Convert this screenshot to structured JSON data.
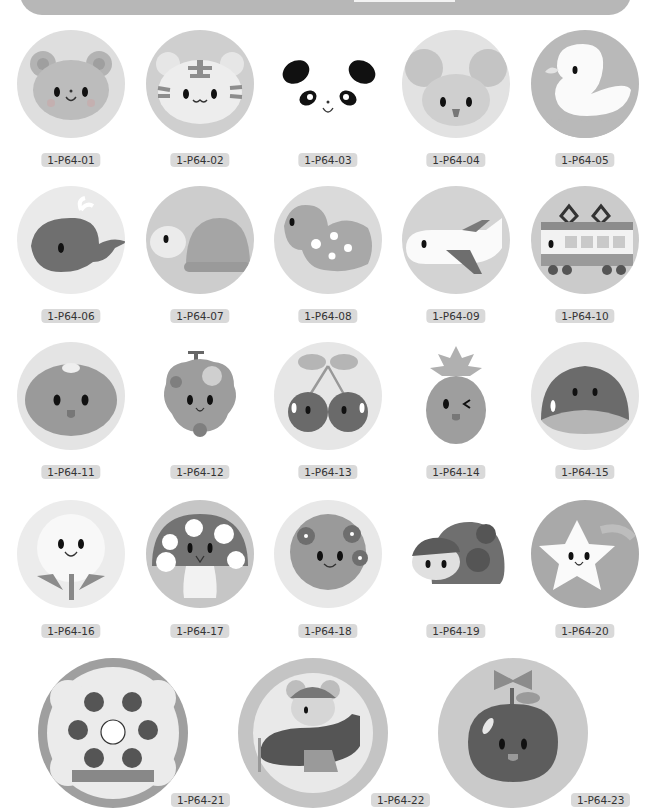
{
  "banner": {
    "tab_label": ""
  },
  "items": [
    {
      "id": "1-P64-01",
      "subject": "bear",
      "icon": "bear-icon",
      "bg": "#dedede"
    },
    {
      "id": "1-P64-02",
      "subject": "tiger",
      "icon": "tiger-icon",
      "bg": "#cfcfcf"
    },
    {
      "id": "1-P64-03",
      "subject": "panda",
      "icon": "panda-icon",
      "bg": "#ffffff"
    },
    {
      "id": "1-P64-04",
      "subject": "mouse",
      "icon": "mouse-icon",
      "bg": "#e2e2e2"
    },
    {
      "id": "1-P64-05",
      "subject": "duck",
      "icon": "duck-icon",
      "bg": "#b9b9b9"
    },
    {
      "id": "1-P64-06",
      "subject": "whale",
      "icon": "whale-icon",
      "bg": "#eaeaea"
    },
    {
      "id": "1-P64-07",
      "subject": "turtle",
      "icon": "turtle-icon",
      "bg": "#cdcdcd"
    },
    {
      "id": "1-P64-08",
      "subject": "dinosaur",
      "icon": "dinosaur-icon",
      "bg": "#dadada"
    },
    {
      "id": "1-P64-09",
      "subject": "airplane",
      "icon": "airplane-icon",
      "bg": "#d3d3d3"
    },
    {
      "id": "1-P64-10",
      "subject": "train",
      "icon": "train-icon",
      "bg": "#cbcbcb"
    },
    {
      "id": "1-P64-11",
      "subject": "orange",
      "icon": "orange-icon",
      "bg": "#e4e4e4"
    },
    {
      "id": "1-P64-12",
      "subject": "grapes",
      "icon": "grapes-icon",
      "bg": "#ffffff"
    },
    {
      "id": "1-P64-13",
      "subject": "cherries",
      "icon": "cherries-icon",
      "bg": "#e6e6e6"
    },
    {
      "id": "1-P64-14",
      "subject": "pineapple",
      "icon": "pineapple-icon",
      "bg": "#ffffff"
    },
    {
      "id": "1-P64-15",
      "subject": "chestnut",
      "icon": "chestnut-icon",
      "bg": "#e4e4e4"
    },
    {
      "id": "1-P64-16",
      "subject": "dandelion",
      "icon": "dandelion-icon",
      "bg": "#ececec"
    },
    {
      "id": "1-P64-17",
      "subject": "mushroom",
      "icon": "mushroom-icon",
      "bg": "#c6c6c6"
    },
    {
      "id": "1-P64-18",
      "subject": "hydrangea",
      "icon": "hydrangea-icon",
      "bg": "#e8e8e8"
    },
    {
      "id": "1-P64-19",
      "subject": "ladybug",
      "icon": "ladybug-icon",
      "bg": "#ffffff"
    },
    {
      "id": "1-P64-20",
      "subject": "star",
      "icon": "star-icon",
      "bg": "#a9a9a9"
    },
    {
      "id": "1-P64-21",
      "subject": "strawberry-cake",
      "icon": "cake-icon",
      "bg": "#9f9f9f"
    },
    {
      "id": "1-P64-22",
      "subject": "mouse-pilot-airplane",
      "icon": "pilot-icon",
      "bg": "#c4c4c4"
    },
    {
      "id": "1-P64-23",
      "subject": "apple-wreath",
      "icon": "apple-icon",
      "bg": "#cacaca"
    }
  ]
}
